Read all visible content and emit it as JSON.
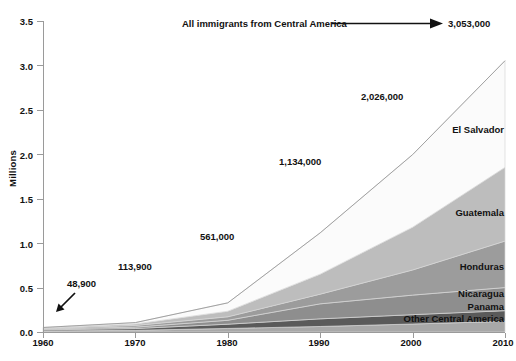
{
  "chart_data": {
    "type": "area",
    "title": "All immigrants from Central America",
    "xlabel": "",
    "ylabel": "Millions",
    "xlim": [
      1960,
      2010
    ],
    "ylim": [
      0.0,
      3.5
    ],
    "grid": false,
    "legend_position": "inline-right",
    "x": [
      1960,
      1970,
      1980,
      1990,
      2000,
      2010
    ],
    "x_ticks": [
      "1960",
      "1970",
      "1980",
      "1990",
      "2000",
      "2010"
    ],
    "y_ticks": [
      "0.0",
      "0.5",
      "1.0",
      "1.5",
      "2.0",
      "2.5",
      "3.0",
      "3.5"
    ],
    "stacked": true,
    "total_values": [
      48900,
      113900,
      561000,
      1134000,
      2026000,
      3053000
    ],
    "annotations": [
      {
        "text": "48,900",
        "x": 1960,
        "arrow": true
      },
      {
        "text": "113,900",
        "x": 1970,
        "arrow": false
      },
      {
        "text": "561,000",
        "x": 1980,
        "arrow": false
      },
      {
        "text": "1,134,000",
        "x": 1990,
        "arrow": false
      },
      {
        "text": "2,026,000",
        "x": 2000,
        "arrow": false
      },
      {
        "text": "3,053,000",
        "x": 2010,
        "arrow": true
      }
    ],
    "series": [
      {
        "name": "Other Central America",
        "color": "#a8a8a8",
        "values": [
          11000,
          19000,
          40000,
          62000,
          90000,
          120000
        ]
      },
      {
        "name": "Panama",
        "color": "#5a5a5a",
        "values": [
          13000,
          20000,
          48000,
          86000,
          105000,
          120000
        ]
      },
      {
        "name": "Nicaragua",
        "color": "#8e8e8e",
        "values": [
          9000,
          16000,
          44000,
          169000,
          220000,
          260000
        ]
      },
      {
        "name": "Honduras",
        "color": "#9c9c9c",
        "values": [
          6500,
          19000,
          39000,
          109000,
          283000,
          523000
        ]
      },
      {
        "name": "Guatemala",
        "color": "#bdbdbd",
        "values": [
          5400,
          17000,
          63000,
          225000,
          481000,
          830000
        ]
      },
      {
        "name": "El Salvador",
        "color": "#fbfbfb",
        "values": [
          6000,
          15000,
          94000,
          465000,
          817000,
          1200000
        ]
      }
    ]
  },
  "callouts": {
    "c0": "48,900",
    "c1": "113,900",
    "c2": "561,000",
    "c3": "1,134,000",
    "c4": "2,026,000",
    "total": "3,053,000"
  },
  "axis": {
    "title": "All immigrants from Central America",
    "ylabel": "Millions",
    "y_ticks": [
      "3.5",
      "3.0",
      "2.5",
      "2.0",
      "1.5",
      "1.0",
      "0.5",
      "0.0"
    ],
    "x_ticks": [
      "1960",
      "1970",
      "1980",
      "1990",
      "2000",
      "2010"
    ]
  },
  "series_labels": {
    "el_salvador": "El Salvador",
    "guatemala": "Guatemala",
    "honduras": "Honduras",
    "nicaragua": "Nicaragua",
    "panama": "Panama",
    "other": "Other Central America"
  }
}
